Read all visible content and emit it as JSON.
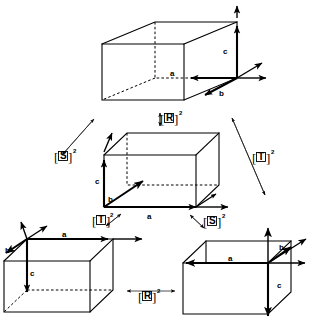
{
  "figure": {
    "background_color": "#ffffff",
    "ink_color": "#000000",
    "cells": [
      {
        "id": "cell-top",
        "name": "top-unit-cell",
        "position": "top-center",
        "axis_labels": {
          "a": "a",
          "b": "b",
          "c": "c"
        },
        "origin_corner": "front-bottom-right",
        "a_direction": "left",
        "b_direction": "down-right",
        "c_direction": "up"
      },
      {
        "id": "cell-middle",
        "name": "middle-unit-cell",
        "position": "center",
        "axis_labels": {
          "a": "a",
          "b": "b",
          "c": "c"
        },
        "origin_corner": "front-bottom-left",
        "a_direction": "right",
        "b_direction": "up-right",
        "c_direction": "up"
      },
      {
        "id": "cell-bottom-left",
        "name": "bottom-left-unit-cell",
        "position": "bottom-left",
        "axis_labels": {
          "a": "a",
          "b": "b",
          "c": "c"
        },
        "origin_corner": "back-top-left",
        "a_direction": "right",
        "b_direction": "down-left",
        "c_direction": "down"
      },
      {
        "id": "cell-bottom-right",
        "name": "bottom-right-unit-cell",
        "position": "bottom-right",
        "axis_labels": {
          "a": "a",
          "b": "b",
          "c": "c"
        },
        "origin_corner": "back-top-right",
        "a_direction": "left",
        "b_direction": "up-right",
        "c_direction": "down"
      }
    ],
    "operators": [
      {
        "id": "op-R-top",
        "letter": "R",
        "exponent": "2",
        "text": "[R]2",
        "arrow": "vertical-double-headed",
        "relates": "top-unit-cell to middle-unit-cell"
      },
      {
        "id": "op-S-left",
        "letter": "S",
        "exponent": "2",
        "text": "[S]2",
        "arrow": "diagonal-double-headed",
        "relates": "top-unit-cell to middle-unit-cell"
      },
      {
        "id": "op-T-right",
        "letter": "T",
        "exponent": "2",
        "text": "[T]2",
        "arrow": "diagonal-double-headed",
        "relates": "top-unit-cell to bottom-right-unit-cell"
      },
      {
        "id": "op-T-lower",
        "letter": "T",
        "exponent": "2",
        "text": "[T]2",
        "arrow": "short-diagonal-double-headed",
        "relates": "middle-unit-cell to bottom-left-unit-cell"
      },
      {
        "id": "op-S-lower",
        "letter": "S",
        "exponent": "2",
        "text": "[S]2",
        "arrow": "short-diagonal-double-headed",
        "relates": "middle-unit-cell to bottom-right-unit-cell"
      },
      {
        "id": "op-R-bottom",
        "letter": "R",
        "exponent": "2",
        "text": "[R]2",
        "arrow": "horizontal-double-headed",
        "relates": "bottom-left-unit-cell to bottom-right-unit-cell"
      }
    ],
    "bracket_open": "[",
    "bracket_close": "]"
  }
}
